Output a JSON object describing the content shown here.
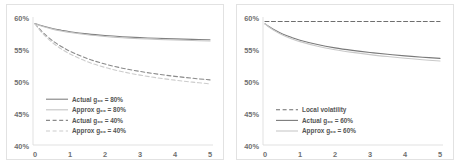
{
  "figure": {
    "background": "#ffffff",
    "border_color": "#e2e2e2"
  },
  "chart_data": [
    {
      "type": "line",
      "panel": "left",
      "title": "",
      "xlabel": "",
      "ylabel": "",
      "xlim": [
        0,
        5
      ],
      "ylim": [
        0.4,
        0.6
      ],
      "grid": false,
      "legend_position": "lower-left",
      "xticks": [
        "0",
        "1",
        "2",
        "3",
        "4",
        "5"
      ],
      "xtick_values": [
        0,
        1,
        2,
        3,
        4,
        5
      ],
      "yticks": [
        "40%",
        "45%",
        "50%",
        "55%",
        "60%"
      ],
      "ytick_values": [
        0.4,
        0.45,
        0.5,
        0.55,
        0.6
      ],
      "x": [
        0,
        0.1,
        0.25,
        0.5,
        0.75,
        1.0,
        1.5,
        2.0,
        2.5,
        3.0,
        3.5,
        4.0,
        4.5,
        5.0
      ],
      "series": [
        {
          "name": "Actual g₀₀ = 80%",
          "label": "Actual g₀₀ = 80%",
          "style": "solid",
          "color": "#808080",
          "width": 1.1,
          "values": [
            0.5895,
            0.588,
            0.5855,
            0.582,
            0.5793,
            0.577,
            0.5736,
            0.5711,
            0.5692,
            0.5678,
            0.5667,
            0.5658,
            0.565,
            0.5644
          ]
        },
        {
          "name": "Approx g₀₀ = 80%",
          "label": "Approx g₀₀ = 80%",
          "style": "solid",
          "color": "#c4c4c4",
          "width": 1.1,
          "values": [
            0.5895,
            0.5876,
            0.5848,
            0.5811,
            0.5782,
            0.5758,
            0.5722,
            0.5696,
            0.5676,
            0.5661,
            0.565,
            0.564,
            0.5632,
            0.5626
          ]
        },
        {
          "name": "Actual g₀₀ = 40%",
          "label": "Actual g₀₀ = 40%",
          "style": "dashed",
          "color": "#8a8a8a",
          "width": 1.1,
          "values": [
            0.5895,
            0.583,
            0.5745,
            0.563,
            0.554,
            0.5465,
            0.535,
            0.5265,
            0.52,
            0.515,
            0.5108,
            0.5073,
            0.5043,
            0.5018
          ]
        },
        {
          "name": "Approx g₀₀ = 40%",
          "label": "Approx g₀₀ = 40%",
          "style": "dashed",
          "color": "#cccccc",
          "width": 1.1,
          "values": [
            0.5895,
            0.582,
            0.5725,
            0.56,
            0.5502,
            0.5422,
            0.53,
            0.5212,
            0.5145,
            0.5092,
            0.5049,
            0.5013,
            0.4982,
            0.4955
          ]
        }
      ]
    },
    {
      "type": "line",
      "panel": "right",
      "title": "",
      "xlabel": "",
      "ylabel": "",
      "xlim": [
        0,
        5
      ],
      "ylim": [
        0.4,
        0.6
      ],
      "grid": false,
      "legend_position": "lower-left",
      "xticks": [
        "0",
        "1",
        "2",
        "3",
        "4",
        "5"
      ],
      "xtick_values": [
        0,
        1,
        2,
        3,
        4,
        5
      ],
      "yticks": [
        "40%",
        "45%",
        "50%",
        "55%",
        "60%"
      ],
      "ytick_values": [
        0.4,
        0.45,
        0.5,
        0.55,
        0.6
      ],
      "x": [
        0,
        0.1,
        0.25,
        0.5,
        0.75,
        1.0,
        1.5,
        2.0,
        2.5,
        3.0,
        3.5,
        4.0,
        4.5,
        5.0
      ],
      "series": [
        {
          "name": "Local volatility",
          "label": "Local volatility",
          "style": "dashed",
          "color": "#6e6e6e",
          "width": 1.1,
          "values": [
            0.593,
            0.593,
            0.593,
            0.593,
            0.593,
            0.593,
            0.593,
            0.593,
            0.593,
            0.593,
            0.593,
            0.593,
            0.593,
            0.593
          ]
        },
        {
          "name": "Actual g₀₀ = 60%",
          "label": "Actual g₀₀ = 60%",
          "style": "solid",
          "color": "#7a7a7a",
          "width": 1.1,
          "values": [
            0.5895,
            0.5855,
            0.5805,
            0.5735,
            0.5682,
            0.5638,
            0.557,
            0.5518,
            0.5478,
            0.5445,
            0.5417,
            0.5393,
            0.5372,
            0.5353
          ]
        },
        {
          "name": "Approx g₀₀ = 60%",
          "label": "Approx g₀₀ = 60%",
          "style": "solid",
          "color": "#c9c9c9",
          "width": 1.1,
          "values": [
            0.5895,
            0.5848,
            0.5793,
            0.5718,
            0.5661,
            0.5615,
            0.5543,
            0.5489,
            0.5447,
            0.5412,
            0.5382,
            0.5356,
            0.5333,
            0.5312
          ]
        }
      ]
    }
  ]
}
